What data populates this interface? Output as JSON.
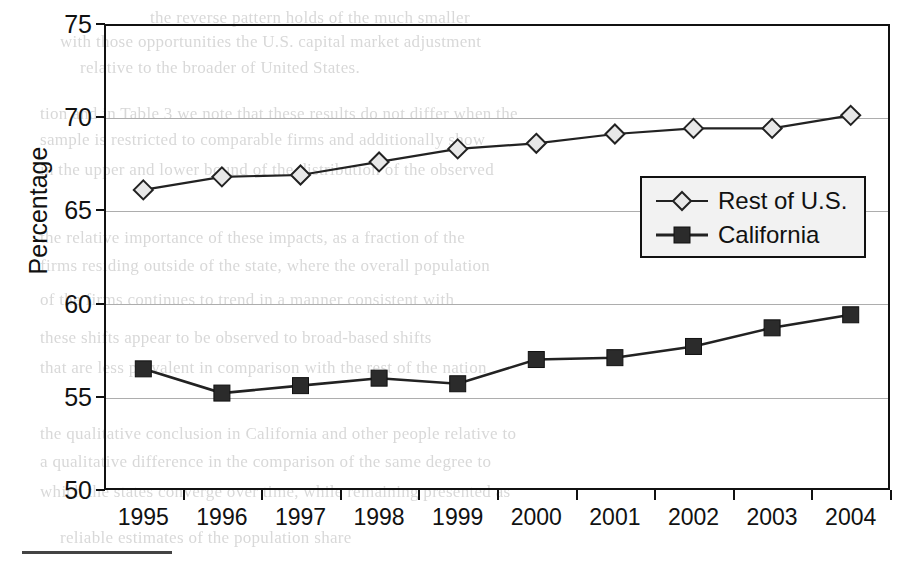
{
  "chart_data": {
    "type": "line",
    "title": "",
    "xlabel": "",
    "ylabel": "Percentage",
    "categories": [
      "1995",
      "1996",
      "1997",
      "1998",
      "1999",
      "2000",
      "2001",
      "2002",
      "2003",
      "2004"
    ],
    "ylim": [
      50,
      75
    ],
    "yticks": [
      50,
      55,
      60,
      65,
      70,
      75
    ],
    "grid": true,
    "legend_position": "center-right",
    "series": [
      {
        "name": "Rest of U.S.",
        "marker": "diamond-open",
        "color": "#222222",
        "values": [
          66.1,
          66.8,
          66.9,
          67.6,
          68.3,
          68.6,
          69.1,
          69.4,
          69.4,
          70.1
        ]
      },
      {
        "name": "California",
        "marker": "square-filled",
        "color": "#222222",
        "values": [
          56.5,
          55.2,
          55.6,
          56.0,
          55.7,
          57.0,
          57.1,
          57.7,
          58.7,
          59.4
        ]
      }
    ]
  },
  "axis": {
    "y_title": "Percentage",
    "y_tick_labels": [
      "75",
      "70",
      "65",
      "60",
      "55",
      "50"
    ],
    "x_tick_labels": [
      "1995",
      "1996",
      "1997",
      "1998",
      "1999",
      "2000",
      "2001",
      "2002",
      "2003",
      "2004"
    ]
  },
  "legend": {
    "items": [
      {
        "label": "Rest of U.S.",
        "marker": "diamond-open"
      },
      {
        "label": "California",
        "marker": "square-filled"
      }
    ]
  },
  "page_background": {
    "ghost_text": [
      {
        "text": "the reverse pattern holds of the much smaller",
        "x": 150,
        "y": 8
      },
      {
        "text": "with those opportunities the U.S. capital market adjustment",
        "x": 60,
        "y": 32
      },
      {
        "text": "relative to the broader of United States.",
        "x": 80,
        "y": 58
      },
      {
        "text": "tion and in Table 3 we note that these results do not differ when the",
        "x": 40,
        "y": 104
      },
      {
        "text": "sample is restricted to comparable firms and additionally show",
        "x": 40,
        "y": 130
      },
      {
        "text": "in the upper and lower bound of the distribution of the observed",
        "x": 40,
        "y": 160
      },
      {
        "text": "the relative importance of these impacts, as a fraction of the",
        "x": 40,
        "y": 228
      },
      {
        "text": "firms residing outside of the state, where the overall population",
        "x": 40,
        "y": 256
      },
      {
        "text": "of the firms continues to trend in a manner consistent with",
        "x": 40,
        "y": 290
      },
      {
        "text": "these shifts appear to be observed to broad-based shifts",
        "x": 40,
        "y": 328
      },
      {
        "text": "that are less prevalent in comparison with the rest of the nation",
        "x": 40,
        "y": 358
      },
      {
        "text": "the qualitative conclusion in California and other people relative to",
        "x": 40,
        "y": 424
      },
      {
        "text": "a qualitative difference in the comparison of the same degree to",
        "x": 40,
        "y": 452
      },
      {
        "text": "which the states converge over time, while remaining presented as",
        "x": 40,
        "y": 482
      },
      {
        "text": "reliable estimates of the population share",
        "x": 60,
        "y": 528
      }
    ]
  },
  "colors": {
    "frame": "#111111",
    "gridline": "#adadad",
    "series_line": "#222222",
    "legend_background": "#f2f2f2",
    "marker_open_fill": "#e8e8e8",
    "marker_filled": "#2b2b2b"
  }
}
